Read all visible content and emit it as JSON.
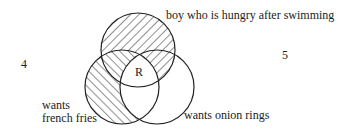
{
  "diagram": {
    "type": "venn",
    "sets": [
      {
        "id": "top",
        "label": "boy who is hungry after swimming"
      },
      {
        "id": "left",
        "label_line1": "wants",
        "label_line2": "french fries"
      },
      {
        "id": "right",
        "label": "wants onion rings"
      }
    ],
    "region_label": "R",
    "outside_left_number": "4",
    "outside_right_number": "5",
    "stroke_color": "#222222",
    "fill_color": "#ffffff"
  }
}
